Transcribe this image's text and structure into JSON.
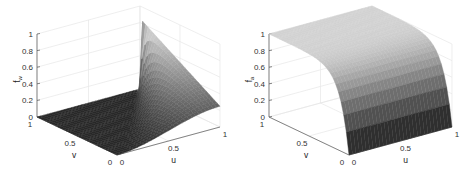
{
  "chart_data": [
    {
      "type": "surface",
      "title": "",
      "xlabel": "u",
      "ylabel": "v",
      "zlabel": "f_w",
      "xlim": [
        0,
        1
      ],
      "ylim": [
        0,
        1
      ],
      "zlim": [
        0,
        1
      ],
      "xticks": [
        "0",
        "0.5",
        "1"
      ],
      "yticks": [
        "0",
        "0.5",
        "1"
      ],
      "zticks": [
        "0",
        "0.2",
        "0.4",
        "0.6",
        "0.8",
        "1"
      ],
      "grid": true,
      "colormap": "gray",
      "description": "Surface is 0 for u <= v (dark flat triangle), rising for u > v; along u=1 edge value grows from ~0 at v=0 to ~0.85 at v=1",
      "samples": {
        "u": [
          0,
          0.25,
          0.5,
          0.75,
          1
        ],
        "v": [
          0,
          0.25,
          0.5,
          0.75,
          1
        ],
        "z": [
          [
            0,
            0.0,
            0.0,
            0.0,
            0.0
          ],
          [
            0,
            0.05,
            0.1,
            0.18,
            0.25
          ],
          [
            0,
            0.08,
            0.22,
            0.35,
            0.45
          ],
          [
            0,
            0.12,
            0.3,
            0.5,
            0.65
          ],
          [
            0,
            0.15,
            0.38,
            0.62,
            0.85
          ]
        ]
      }
    },
    {
      "type": "surface",
      "title": "",
      "xlabel": "u",
      "ylabel": "v",
      "zlabel": "f_a",
      "xlim": [
        0,
        1
      ],
      "ylim": [
        0,
        1
      ],
      "zlim": [
        0,
        1
      ],
      "xticks": [
        "0",
        "0.5",
        "1"
      ],
      "yticks": [
        "0",
        "0.5",
        "1"
      ],
      "zticks": [
        "0",
        "0.2",
        "0.4",
        "0.6",
        "0.8",
        "1"
      ],
      "grid": true,
      "colormap": "gray",
      "description": "Surface rises steeply from 0 at v=0 to ~1 for v>0.3, nearly independent of u",
      "samples": {
        "u": [
          0,
          0.25,
          0.5,
          0.75,
          1
        ],
        "v": [
          0,
          0.1,
          0.25,
          0.5,
          0.75,
          1
        ],
        "z": [
          [
            0,
            0,
            0,
            0,
            0
          ],
          [
            0.6,
            0.6,
            0.6,
            0.6,
            0.6
          ],
          [
            0.85,
            0.85,
            0.85,
            0.85,
            0.85
          ],
          [
            0.96,
            0.96,
            0.96,
            0.96,
            0.96
          ],
          [
            0.99,
            0.99,
            0.99,
            0.99,
            0.99
          ],
          [
            1,
            1,
            1,
            1,
            1
          ]
        ]
      }
    }
  ],
  "plots": [
    {
      "zlabel_main": "f",
      "zlabel_sub": "w",
      "xlabel": "u",
      "ylabel": "v",
      "zticks": [
        "0",
        "0.2",
        "0.4",
        "0.6",
        "0.8",
        "1"
      ],
      "uticks": [
        "0",
        "0.5",
        "1"
      ],
      "vticks": [
        "0",
        "0.5",
        "1"
      ]
    },
    {
      "zlabel_main": "f",
      "zlabel_sub": "a",
      "xlabel": "u",
      "ylabel": "v",
      "zticks": [
        "0",
        "0.2",
        "0.4",
        "0.6",
        "0.8",
        "1"
      ],
      "uticks": [
        "0",
        "0.5",
        "1"
      ],
      "vticks": [
        "0",
        "0.5",
        "1"
      ]
    }
  ]
}
